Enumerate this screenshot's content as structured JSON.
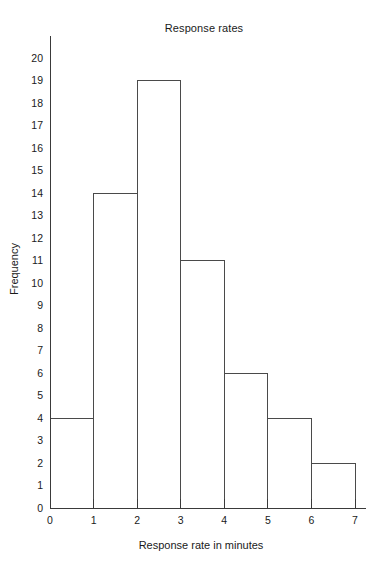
{
  "chart_data": {
    "type": "bar",
    "title": "Response rates",
    "xlabel": "Response rate in minutes",
    "ylabel": "Frequency",
    "categories": [
      "0-1",
      "1-2",
      "2-3",
      "3-4",
      "4-5",
      "5-6",
      "6-7"
    ],
    "bin_edges": [
      0,
      1,
      2,
      3,
      4,
      5,
      6,
      7
    ],
    "values": [
      4,
      14,
      19,
      11,
      6,
      4,
      2
    ],
    "xlim": [
      0,
      7
    ],
    "ylim": [
      0,
      20
    ],
    "x_tick_labels": [
      "0",
      "1",
      "2",
      "3",
      "4",
      "5",
      "6",
      "7"
    ],
    "y_tick_labels": [
      "0",
      "1",
      "2",
      "3",
      "4",
      "5",
      "6",
      "7",
      "8",
      "9",
      "10",
      "11",
      "12",
      "13",
      "14",
      "15",
      "16",
      "17",
      "18",
      "19",
      "20"
    ],
    "grid": false,
    "legend": null,
    "style": {
      "bar_fill": "#ffffff",
      "bar_stroke": "#4a4a4a",
      "axis_color": "#3a3a3a",
      "text_color": "#1a1a1a",
      "background": "#ffffff"
    }
  }
}
